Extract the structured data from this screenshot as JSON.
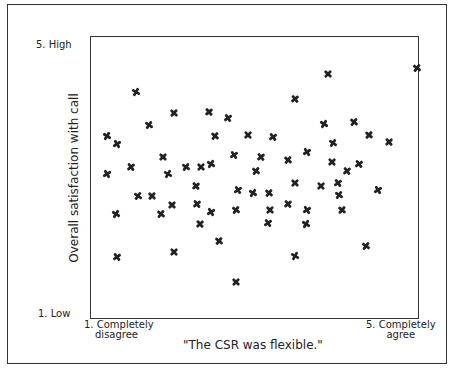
{
  "chart_data": {
    "type": "scatter",
    "title": "",
    "xlabel": "\"The CSR was flexible.\"",
    "ylabel": "Overall satisfaction with call",
    "x_tick_labels": [
      {
        "value": 1,
        "line1": "1. Completely",
        "line2": "disagree"
      },
      {
        "value": 5,
        "line1": "5. Completely",
        "line2": "agree"
      }
    ],
    "y_tick_labels": [
      {
        "value": 5,
        "label": "5. High"
      },
      {
        "value": 1,
        "label": "1. Low"
      }
    ],
    "xlim": [
      1,
      5
    ],
    "ylim": [
      1,
      5
    ],
    "grid": false,
    "legend": null,
    "marker": "cross",
    "marker_color": "#222222",
    "points": [
      {
        "x": 1.55,
        "y": 4.23
      },
      {
        "x": 4.96,
        "y": 4.56
      },
      {
        "x": 3.88,
        "y": 4.48
      },
      {
        "x": 3.48,
        "y": 4.13
      },
      {
        "x": 1.32,
        "y": 3.49
      },
      {
        "x": 1.71,
        "y": 3.75
      },
      {
        "x": 2.01,
        "y": 3.92
      },
      {
        "x": 2.43,
        "y": 3.94
      },
      {
        "x": 2.66,
        "y": 3.86
      },
      {
        "x": 1.19,
        "y": 3.6
      },
      {
        "x": 2.51,
        "y": 3.6
      },
      {
        "x": 2.91,
        "y": 3.62
      },
      {
        "x": 3.21,
        "y": 3.59
      },
      {
        "x": 3.83,
        "y": 3.77
      },
      {
        "x": 4.2,
        "y": 3.8
      },
      {
        "x": 1.88,
        "y": 3.3
      },
      {
        "x": 1.49,
        "y": 3.16
      },
      {
        "x": 1.2,
        "y": 3.07
      },
      {
        "x": 2.15,
        "y": 3.17
      },
      {
        "x": 2.34,
        "y": 3.17
      },
      {
        "x": 3.07,
        "y": 3.31
      },
      {
        "x": 3.62,
        "y": 3.37
      },
      {
        "x": 3.94,
        "y": 3.5
      },
      {
        "x": 4.38,
        "y": 3.62
      },
      {
        "x": 4.62,
        "y": 3.52
      },
      {
        "x": 2.74,
        "y": 3.33
      },
      {
        "x": 2.46,
        "y": 3.21
      },
      {
        "x": 3.4,
        "y": 3.26
      },
      {
        "x": 3.93,
        "y": 3.23
      },
      {
        "x": 4.26,
        "y": 3.2
      },
      {
        "x": 1.93,
        "y": 3.06
      },
      {
        "x": 3.01,
        "y": 3.1
      },
      {
        "x": 3.48,
        "y": 2.94
      },
      {
        "x": 4.11,
        "y": 3.11
      },
      {
        "x": 4.49,
        "y": 2.84
      },
      {
        "x": 1.57,
        "y": 2.76
      },
      {
        "x": 1.74,
        "y": 2.76
      },
      {
        "x": 2.27,
        "y": 2.9
      },
      {
        "x": 2.79,
        "y": 2.84
      },
      {
        "x": 2.97,
        "y": 2.79
      },
      {
        "x": 3.16,
        "y": 2.79
      },
      {
        "x": 3.79,
        "y": 2.9
      },
      {
        "x": 4.0,
        "y": 2.94
      },
      {
        "x": 1.3,
        "y": 2.5
      },
      {
        "x": 1.85,
        "y": 2.5
      },
      {
        "x": 1.98,
        "y": 2.62
      },
      {
        "x": 2.29,
        "y": 2.64
      },
      {
        "x": 2.46,
        "y": 2.53
      },
      {
        "x": 2.76,
        "y": 2.56
      },
      {
        "x": 3.18,
        "y": 2.55
      },
      {
        "x": 3.39,
        "y": 2.64
      },
      {
        "x": 3.63,
        "y": 2.55
      },
      {
        "x": 4.02,
        "y": 2.77
      },
      {
        "x": 4.05,
        "y": 2.55
      },
      {
        "x": 2.33,
        "y": 2.36
      },
      {
        "x": 3.15,
        "y": 2.37
      },
      {
        "x": 3.61,
        "y": 2.36
      },
      {
        "x": 2.55,
        "y": 2.12
      },
      {
        "x": 2.01,
        "y": 1.96
      },
      {
        "x": 1.32,
        "y": 1.89
      },
      {
        "x": 3.48,
        "y": 1.9
      },
      {
        "x": 4.34,
        "y": 2.04
      },
      {
        "x": 2.76,
        "y": 1.54
      }
    ]
  },
  "labels": {
    "y_high": "5. High",
    "y_low": "1. Low",
    "y_title": "Overall satisfaction with call",
    "x_left_line1": "1. Completely",
    "x_left_line2": "disagree",
    "x_right_line1": "5. Completely",
    "x_right_line2": "agree",
    "x_title": "\"The CSR was flexible.\""
  }
}
